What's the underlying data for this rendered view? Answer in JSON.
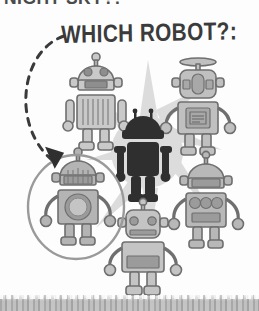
{
  "page": {
    "background_color": "#fdfdfd",
    "width": 259,
    "height": 311
  },
  "headline": {
    "text": "NIGHT SKY?:",
    "note": "clipped at top edge of page"
  },
  "caption": {
    "text": "WHICH ROBOT?:"
  },
  "annotation": {
    "arrow_name": "dashed-curved-arrow",
    "circle_name": "answer-circle",
    "circle_color": "#9a9a9a",
    "arrow_color": "#3a3a3a"
  },
  "colors": {
    "robot_light": "#c9c9c9",
    "robot_mid": "#a8a8a8",
    "robot_dark": "#8e8e8e",
    "outline": "#6f6f6f",
    "silhouette": "#2f2f2f",
    "starburst": "#d8d8d8",
    "strip": "#a8a8a8"
  },
  "robots": [
    {
      "id": "robot-top-left",
      "label": "Robot top left",
      "head": "dome",
      "antenna": "ball",
      "chest": "vertical-grille",
      "shade": "#c9c9c9",
      "circled": false
    },
    {
      "id": "robot-top-right",
      "label": "Robot top right",
      "head": "rounded-square",
      "antenna": "dish",
      "chest": "screen-panel",
      "shade": "#c0c0c0",
      "circled": false
    },
    {
      "id": "robot-center-silhouette",
      "label": "Robot center silhouette",
      "head": "dome",
      "antenna": "two-prong",
      "chest": "solid",
      "shade": "#2f2f2f",
      "circled": false
    },
    {
      "id": "robot-mid-left",
      "label": "Robot mid left",
      "head": "dome",
      "antenna": "ball",
      "chest": "round-dial",
      "shade": "#b4b4b4",
      "circled": true
    },
    {
      "id": "robot-mid-right",
      "label": "Robot mid right",
      "head": "dome",
      "antenna": "ball",
      "chest": "three-buttons",
      "shade": "#b8b8b8",
      "circled": false
    },
    {
      "id": "robot-bottom-center",
      "label": "Robot bottom center",
      "head": "rounded-square",
      "antenna": "ball",
      "chest": "plain-panel",
      "shade": "#c4c4c4",
      "circled": false
    }
  ]
}
